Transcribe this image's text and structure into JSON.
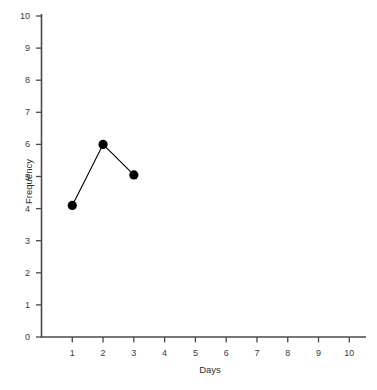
{
  "chart_data": {
    "type": "line",
    "title": "",
    "xlabel": "Days",
    "ylabel": "Frequency",
    "x": [
      1,
      2,
      3
    ],
    "values": [
      4.1,
      6.0,
      5.05
    ],
    "series": [
      {
        "name": "Frequency",
        "x": [
          1,
          2,
          3
        ],
        "values": [
          4.1,
          6.0,
          5.05
        ]
      }
    ],
    "xlim": [
      0,
      10.95
    ],
    "ylim": [
      0,
      10.35
    ],
    "xticks": [
      1,
      2,
      3,
      4,
      5,
      6,
      7,
      8,
      9,
      10
    ],
    "yticks": [
      0,
      1,
      2,
      3,
      4,
      5,
      6,
      7,
      8,
      9,
      10
    ],
    "xtick_labels": [
      "1",
      "2",
      "3",
      "4",
      "5",
      "6",
      "7",
      "8",
      "9",
      "10"
    ],
    "ytick_labels": [
      "0",
      "1",
      "2",
      "3",
      "4",
      "5",
      "6",
      "7",
      "8",
      "9",
      "10"
    ],
    "grid": false,
    "legend": "none",
    "marker": "filled-circle",
    "marker_color": "#000000",
    "line_color": "#000000",
    "axis_color": "#4a4a4a",
    "background_color": "#ffffff"
  }
}
